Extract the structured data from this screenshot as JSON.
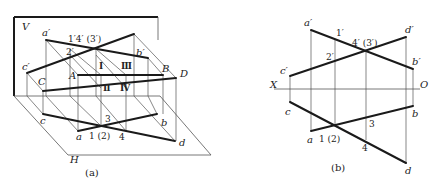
{
  "figure": {
    "colors": {
      "thin_line": "#555555",
      "thick_line": "#1a1a1a",
      "text": "#222222",
      "background": "#ffffff"
    }
  },
  "panel_a": {
    "caption": "(a)",
    "plane_labels": {
      "V": "V",
      "H": "H"
    },
    "space_points": {
      "A": "A",
      "B": "B",
      "C": "C",
      "D": "D"
    },
    "v_projection_labels": {
      "a_prime": "a′",
      "b_prime": "b′",
      "c_prime": "c′",
      "d_prime": "d′",
      "p2_prime": "2′",
      "p14_3_prime": "1′4′ (3′)"
    },
    "h_projection_labels": {
      "a": "a",
      "b": "b",
      "c": "c",
      "d": "d",
      "p3": "3",
      "p1_2": "1 (2)",
      "p4": "4"
    },
    "roman_labels": {
      "I": "Ⅰ",
      "II": "Ⅱ",
      "III": "Ⅲ",
      "IV": "Ⅳ"
    }
  },
  "panel_b": {
    "caption": "(b)",
    "axis_labels": {
      "X": "X",
      "O": "O"
    },
    "v_projection_labels": {
      "a_prime": "a′",
      "b_prime": "b′",
      "c_prime": "c′",
      "d_prime": "d′",
      "p1_prime": "1′",
      "p2_prime": "2′",
      "p4_3_prime": "4′ (3′)"
    },
    "h_projection_labels": {
      "a": "a",
      "b": "b",
      "c": "c",
      "d": "d",
      "p3": "3",
      "p1_2": "1 (2)",
      "p4": "4"
    }
  }
}
